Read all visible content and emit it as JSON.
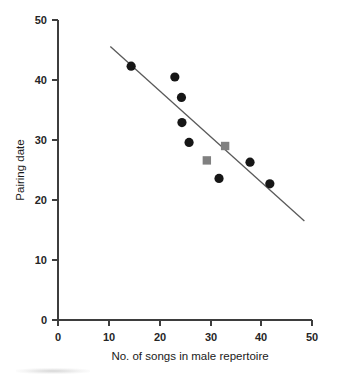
{
  "chart_data": {
    "type": "scatter",
    "title": "",
    "xlabel": "No. of songs in male repertoire",
    "ylabel": "Pairing date",
    "xlim": [
      0,
      50
    ],
    "ylim": [
      0,
      50
    ],
    "xticks": [
      0,
      10,
      20,
      30,
      40,
      50
    ],
    "yticks": [
      0,
      10,
      20,
      30,
      40,
      50
    ],
    "xtick_labels": [
      "0",
      "10",
      "20",
      "30",
      "40",
      "50"
    ],
    "ytick_labels": [
      "0",
      "10",
      "20",
      "30",
      "40",
      "50"
    ],
    "grid": false,
    "legend": false,
    "legend_position": "none",
    "series": [
      {
        "name": "circles",
        "marker": "circle",
        "color": "#161616",
        "points": [
          {
            "x": 14.4,
            "y": 42.3
          },
          {
            "x": 23.0,
            "y": 40.5
          },
          {
            "x": 24.3,
            "y": 37.1
          },
          {
            "x": 24.4,
            "y": 32.9
          },
          {
            "x": 25.8,
            "y": 29.6
          },
          {
            "x": 31.7,
            "y": 23.6
          },
          {
            "x": 37.8,
            "y": 26.3
          },
          {
            "x": 41.7,
            "y": 22.7
          }
        ]
      },
      {
        "name": "squares",
        "marker": "square",
        "color": "#808080",
        "points": [
          {
            "x": 29.3,
            "y": 26.6
          },
          {
            "x": 32.9,
            "y": 29.0
          }
        ]
      }
    ],
    "trendline": {
      "name": "regression-line",
      "color": "#5a5a5a",
      "x_start": 10.3,
      "y_start": 45.6,
      "x_end": 48.5,
      "y_end": 16.5
    },
    "colors": {
      "circle_marker": "#161616",
      "square_marker": "#808080",
      "axis": "#3d3d3d",
      "trendline": "#5a5a5a",
      "background": "#ffffff",
      "text": "#1a1a1a"
    }
  }
}
